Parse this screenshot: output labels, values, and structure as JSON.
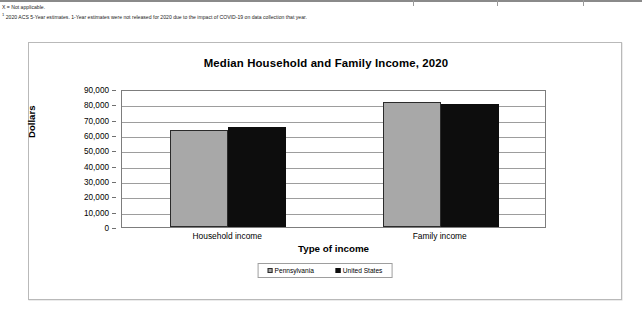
{
  "footnotes": [
    "X = Not applicable.",
    "2020 ACS 5-Year estimates.  1-Year estimates were not released for 2020 due to the impact of COVID-19 on data collection that year."
  ],
  "footnote_marker": "1",
  "chart_data": {
    "type": "bar",
    "title": "Median Household and Family Income, 2020",
    "xlabel": "Type of income",
    "ylabel": "Dollars",
    "categories": [
      "Household income",
      "Family income"
    ],
    "series": [
      {
        "name": "Pennsylvania",
        "color": "#a8a8a8",
        "values": [
          63463,
          81663
        ]
      },
      {
        "name": "United States",
        "color": "#0d0d0d",
        "values": [
          64994,
          80069
        ]
      }
    ],
    "ylim": [
      0,
      90000
    ],
    "ytick_step": 10000,
    "ytick_labels": [
      "90,000",
      "80,000",
      "70,000",
      "60,000",
      "50,000",
      "40,000",
      "30,000",
      "20,000",
      "10,000",
      "0"
    ],
    "grid": true,
    "legend_position": "bottom"
  }
}
